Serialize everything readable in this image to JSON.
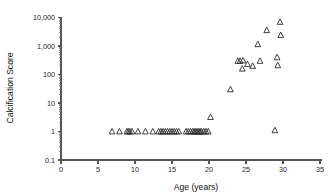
{
  "chart_data": {
    "type": "scatter",
    "title": "",
    "xlabel": "Age (years)",
    "ylabel": "Calcification Score",
    "xlim": [
      0,
      35
    ],
    "ylim": [
      0.1,
      10000
    ],
    "yscale": "log",
    "xscale": "linear",
    "grid": false,
    "legend": null,
    "marker": "open-triangle",
    "xticks": [
      0,
      5,
      10,
      15,
      20,
      25,
      30,
      35
    ],
    "xticklabels": [
      "0",
      "5",
      "10",
      "15",
      "20",
      "25",
      "30",
      "35"
    ],
    "yticks": [
      0.1,
      1,
      10,
      100,
      1000,
      10000
    ],
    "yticklabels": [
      "0.1",
      "1",
      "10",
      "100",
      "1,000",
      "10,000"
    ],
    "series": [
      {
        "name": "patients",
        "points": [
          [
            6.9,
            1
          ],
          [
            7.9,
            1
          ],
          [
            8.9,
            1
          ],
          [
            9.1,
            1
          ],
          [
            9.3,
            1
          ],
          [
            9.6,
            1
          ],
          [
            10.4,
            1
          ],
          [
            11.4,
            1
          ],
          [
            12.4,
            1
          ],
          [
            13.2,
            1
          ],
          [
            13.5,
            1
          ],
          [
            13.8,
            1
          ],
          [
            14.1,
            1
          ],
          [
            14.4,
            1
          ],
          [
            14.7,
            1
          ],
          [
            15.0,
            1
          ],
          [
            15.3,
            1
          ],
          [
            15.6,
            1
          ],
          [
            15.9,
            1
          ],
          [
            16.9,
            1
          ],
          [
            17.2,
            1
          ],
          [
            17.5,
            1
          ],
          [
            17.8,
            1
          ],
          [
            18.0,
            1
          ],
          [
            18.2,
            1
          ],
          [
            18.4,
            1
          ],
          [
            18.6,
            1
          ],
          [
            18.8,
            1
          ],
          [
            19.0,
            1
          ],
          [
            19.3,
            1
          ],
          [
            19.6,
            1
          ],
          [
            19.9,
            1
          ],
          [
            20.2,
            3.2
          ],
          [
            22.9,
            30
          ],
          [
            23.9,
            300
          ],
          [
            24.2,
            300
          ],
          [
            24.5,
            160
          ],
          [
            24.6,
            310
          ],
          [
            25.2,
            230
          ],
          [
            25.9,
            200
          ],
          [
            26.6,
            1150
          ],
          [
            26.9,
            300
          ],
          [
            27.8,
            3600
          ],
          [
            28.9,
            1.1
          ],
          [
            29.2,
            400
          ],
          [
            29.3,
            210
          ],
          [
            29.6,
            7000
          ],
          [
            29.7,
            2400
          ]
        ]
      }
    ]
  },
  "axes": {
    "y_axis_label": "Calcification Score",
    "x_axis_label": "Age (years)"
  }
}
